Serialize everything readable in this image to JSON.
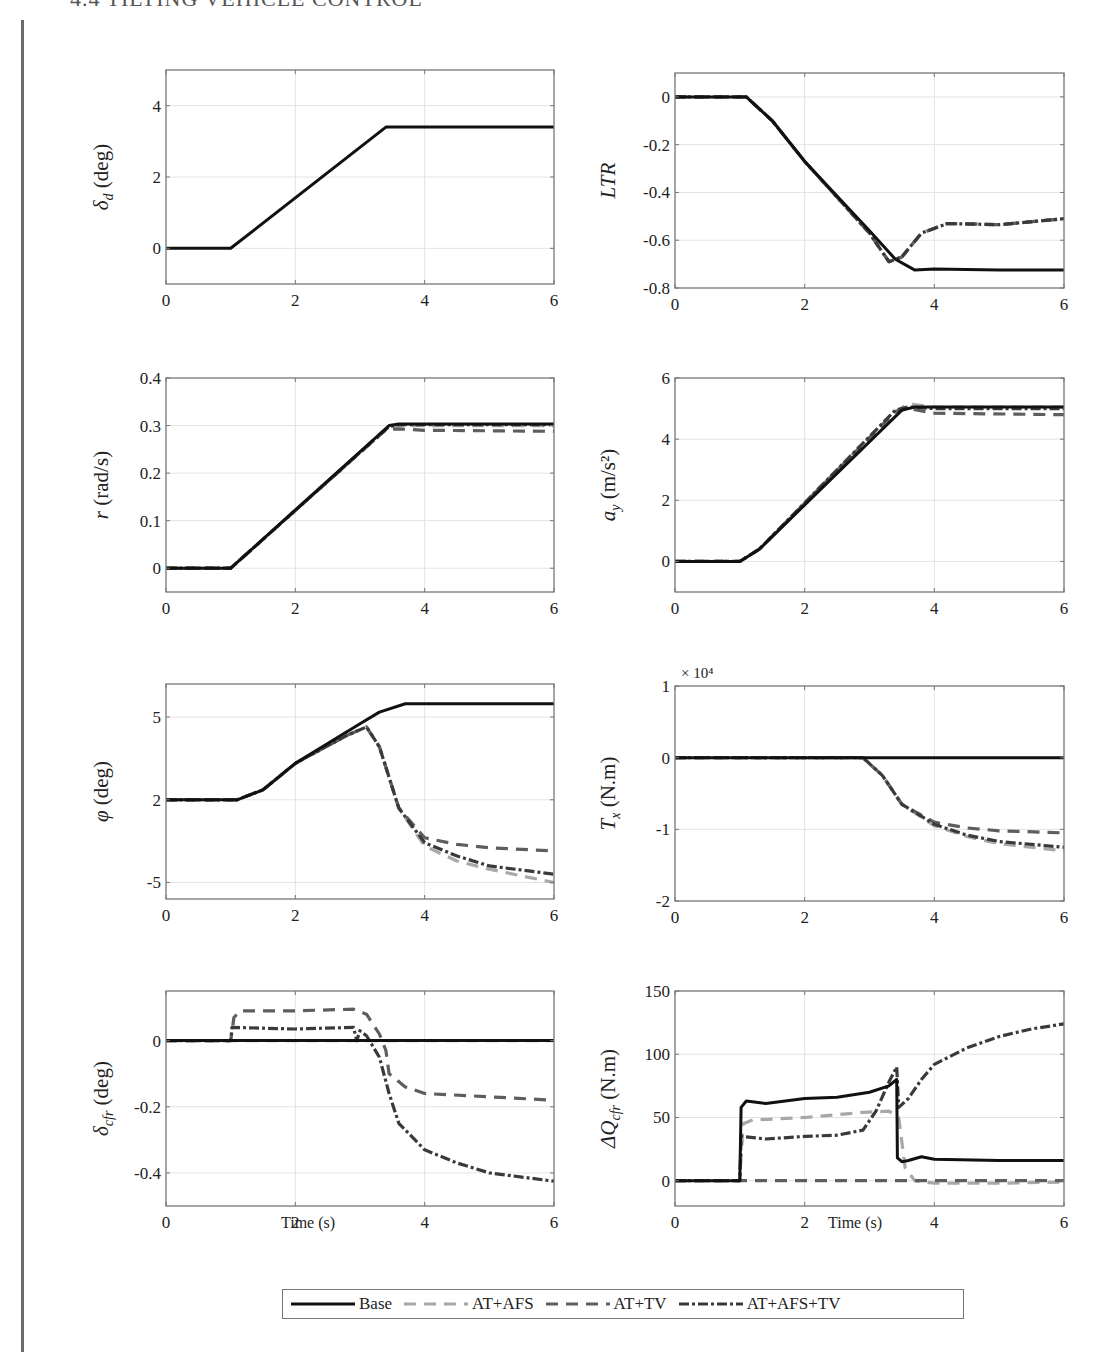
{
  "header": {
    "title": "4.4 TILTING VEHICLE CONTROL"
  },
  "legend": {
    "items": [
      {
        "label": "Base",
        "color": "#111111",
        "dash": "none"
      },
      {
        "label": "AT+AFS",
        "color": "#a8a8a8",
        "dash": "12,8"
      },
      {
        "label": "AT+TV",
        "color": "#5e5e5e",
        "dash": "12,8"
      },
      {
        "label": "AT+AFS+TV",
        "color": "#3a3a3a",
        "dash": "10,3,3,3"
      }
    ]
  },
  "xlabels": {
    "left": "Time (s)",
    "right": "Time (s)"
  },
  "chart_data": [
    {
      "id": "delta_d",
      "type": "line",
      "ylabel": "δd (deg)",
      "ylabel_main": "δ",
      "ylabel_sub": "d",
      "ylabel_unit": " (deg)",
      "xlim": [
        0,
        6
      ],
      "ylim": [
        -1,
        5
      ],
      "xticks": [
        0,
        2,
        4,
        6
      ],
      "yticks": [
        0,
        2,
        4
      ],
      "ytick_labels": [
        "0",
        "2",
        "4"
      ],
      "grid": true,
      "series": [
        {
          "name": "Base",
          "x": [
            0,
            1,
            3.4,
            6
          ],
          "y": [
            0,
            0,
            3.4,
            3.4
          ]
        }
      ]
    },
    {
      "id": "LTR",
      "type": "line",
      "ylabel": "LTR",
      "ylabel_main": "LTR",
      "ylabel_sub": "",
      "ylabel_unit": "",
      "xlim": [
        0,
        6
      ],
      "ylim": [
        -0.8,
        0.1
      ],
      "xticks": [
        0,
        2,
        4,
        6
      ],
      "yticks": [
        0,
        -0.2,
        -0.4,
        -0.6,
        -0.8
      ],
      "ytick_labels": [
        "0",
        "-0.2",
        "-0.4",
        "-0.6",
        "-0.8"
      ],
      "grid": true,
      "series": [
        {
          "name": "Base",
          "x": [
            0,
            1.1,
            1.5,
            2,
            3,
            3.4,
            3.7,
            4,
            5,
            6
          ],
          "y": [
            0,
            0,
            -0.1,
            -0.27,
            -0.56,
            -0.68,
            -0.725,
            -0.72,
            -0.725,
            -0.725
          ]
        },
        {
          "name": "AT+AFS",
          "x": [
            0,
            1.1,
            1.5,
            2,
            3,
            3.3,
            3.5,
            3.8,
            4.2,
            5,
            6
          ],
          "y": [
            0,
            0,
            -0.1,
            -0.27,
            -0.57,
            -0.69,
            -0.67,
            -0.57,
            -0.53,
            -0.535,
            -0.51
          ]
        },
        {
          "name": "AT+TV",
          "x": [
            0,
            1.1,
            1.5,
            2,
            3,
            3.3,
            3.5,
            3.8,
            4.2,
            5,
            6
          ],
          "y": [
            0,
            0,
            -0.1,
            -0.27,
            -0.57,
            -0.69,
            -0.67,
            -0.57,
            -0.53,
            -0.535,
            -0.51
          ]
        },
        {
          "name": "AT+AFS+TV",
          "x": [
            0,
            1.1,
            1.5,
            2,
            3,
            3.3,
            3.5,
            3.8,
            4.2,
            5,
            6
          ],
          "y": [
            0,
            0,
            -0.1,
            -0.27,
            -0.57,
            -0.69,
            -0.67,
            -0.57,
            -0.53,
            -0.535,
            -0.51
          ]
        }
      ]
    },
    {
      "id": "r",
      "type": "line",
      "ylabel": "r (rad/s)",
      "ylabel_main": "r",
      "ylabel_sub": "",
      "ylabel_unit": " (rad/s)",
      "xlim": [
        0,
        6
      ],
      "ylim": [
        -0.05,
        0.4
      ],
      "xticks": [
        0,
        2,
        4,
        6
      ],
      "yticks": [
        0,
        0.1,
        0.2,
        0.3,
        0.4
      ],
      "ytick_labels": [
        "0",
        "0.1",
        "0.2",
        "0.3",
        "0.4"
      ],
      "grid": true,
      "series": [
        {
          "name": "Base",
          "x": [
            0,
            1,
            3.45,
            3.6,
            6
          ],
          "y": [
            0,
            0,
            0.3,
            0.303,
            0.303
          ]
        },
        {
          "name": "AT+AFS",
          "x": [
            0,
            1,
            3.45,
            3.6,
            6
          ],
          "y": [
            0,
            0,
            0.297,
            0.3,
            0.3
          ]
        },
        {
          "name": "AT+TV",
          "x": [
            0,
            1,
            3.4,
            3.6,
            4,
            6
          ],
          "y": [
            0,
            0,
            0.292,
            0.293,
            0.29,
            0.288
          ]
        },
        {
          "name": "AT+AFS+TV",
          "x": [
            0,
            1,
            3.45,
            3.6,
            6
          ],
          "y": [
            0,
            0,
            0.298,
            0.302,
            0.302
          ]
        }
      ]
    },
    {
      "id": "ay",
      "type": "line",
      "ylabel": "ay (m/s²)",
      "ylabel_main": "a",
      "ylabel_sub": "y",
      "ylabel_unit": " (m/s²)",
      "xlim": [
        0,
        6
      ],
      "ylim": [
        -1,
        6
      ],
      "xticks": [
        0,
        2,
        4,
        6
      ],
      "yticks": [
        0,
        2,
        4,
        6
      ],
      "ytick_labels": [
        "0",
        "2",
        "4",
        "6"
      ],
      "grid": true,
      "series": [
        {
          "name": "Base",
          "x": [
            0,
            1,
            1.3,
            3.5,
            3.7,
            6
          ],
          "y": [
            0,
            0,
            0.4,
            4.95,
            5.05,
            5.05
          ]
        },
        {
          "name": "AT+AFS",
          "x": [
            0,
            1,
            1.3,
            3.4,
            3.6,
            4,
            6
          ],
          "y": [
            0,
            0,
            0.4,
            4.9,
            5.15,
            5.05,
            5.05
          ]
        },
        {
          "name": "AT+TV",
          "x": [
            0,
            1,
            1.3,
            3.4,
            3.6,
            4,
            6
          ],
          "y": [
            0,
            0,
            0.4,
            4.9,
            5.0,
            4.85,
            4.8
          ]
        },
        {
          "name": "AT+AFS+TV",
          "x": [
            0,
            1,
            1.3,
            3.4,
            3.6,
            4,
            6
          ],
          "y": [
            0,
            0,
            0.4,
            4.95,
            5.05,
            5.0,
            5.0
          ]
        }
      ]
    },
    {
      "id": "phi",
      "type": "line",
      "ylabel": "φ (deg)",
      "ylabel_main": "φ",
      "ylabel_sub": "",
      "ylabel_unit": " (deg)",
      "xlim": [
        0,
        6
      ],
      "ylim": [
        -6,
        7
      ],
      "xticks": [
        0,
        2,
        4,
        6
      ],
      "yticks": [
        5,
        0,
        -5
      ],
      "ytick_labels": [
        "5",
        "2",
        "-5"
      ],
      "grid": true,
      "series": [
        {
          "name": "Base",
          "x": [
            0,
            1.1,
            1.5,
            2,
            3,
            3.3,
            3.7,
            4,
            6
          ],
          "y": [
            0,
            0,
            0.6,
            2.2,
            4.6,
            5.3,
            5.8,
            5.8,
            5.8
          ]
        },
        {
          "name": "AT+AFS",
          "x": [
            0,
            1.1,
            1.5,
            2,
            2.8,
            3.1,
            3.3,
            3.6,
            4,
            4.5,
            5,
            6
          ],
          "y": [
            0,
            0,
            0.6,
            2.2,
            3.9,
            4.4,
            3.2,
            -0.5,
            -2.8,
            -3.7,
            -4.2,
            -5.0
          ]
        },
        {
          "name": "AT+TV",
          "x": [
            0,
            1.1,
            1.5,
            2,
            2.8,
            3.1,
            3.3,
            3.6,
            4,
            4.5,
            5,
            6
          ],
          "y": [
            0,
            0,
            0.6,
            2.2,
            3.9,
            4.4,
            3.2,
            -0.5,
            -2.3,
            -2.7,
            -2.9,
            -3.1
          ]
        },
        {
          "name": "AT+AFS+TV",
          "x": [
            0,
            1.1,
            1.5,
            2,
            2.8,
            3.1,
            3.3,
            3.6,
            4,
            4.5,
            5,
            6
          ],
          "y": [
            0,
            0,
            0.6,
            2.2,
            3.9,
            4.4,
            3.2,
            -0.5,
            -2.6,
            -3.4,
            -4.0,
            -4.5
          ]
        }
      ]
    },
    {
      "id": "Tx",
      "type": "line",
      "ylabel": "Tx (N.m)",
      "ylabel_main": "T",
      "ylabel_sub": "x",
      "ylabel_unit": " (N.m)",
      "xlim": [
        0,
        6
      ],
      "ylim": [
        -2,
        1
      ],
      "xticks": [
        0,
        2,
        4,
        6
      ],
      "yticks": [
        1,
        0,
        -1,
        -2
      ],
      "ytick_labels": [
        "1",
        "0",
        "-1",
        "-2"
      ],
      "grid": true,
      "scale_label": "× 10⁴",
      "series": [
        {
          "name": "Base",
          "x": [
            0,
            6
          ],
          "y": [
            0,
            0
          ]
        },
        {
          "name": "AT+AFS",
          "x": [
            0,
            2.9,
            3.2,
            3.5,
            4,
            4.5,
            5,
            6
          ],
          "y": [
            0,
            0,
            -0.25,
            -0.65,
            -0.95,
            -1.1,
            -1.2,
            -1.3
          ]
        },
        {
          "name": "AT+TV",
          "x": [
            0,
            2.9,
            3.2,
            3.5,
            4,
            4.5,
            5,
            6
          ],
          "y": [
            0,
            0,
            -0.25,
            -0.65,
            -0.9,
            -0.98,
            -1.02,
            -1.05
          ]
        },
        {
          "name": "AT+AFS+TV",
          "x": [
            0,
            2.9,
            3.2,
            3.5,
            4,
            4.5,
            5,
            6
          ],
          "y": [
            0,
            0,
            -0.25,
            -0.65,
            -0.93,
            -1.08,
            -1.17,
            -1.25
          ]
        }
      ]
    },
    {
      "id": "delta_cfr",
      "type": "line",
      "ylabel": "δcfr (deg)",
      "ylabel_main": "δ",
      "ylabel_sub": "cfr",
      "ylabel_unit": " (deg)",
      "xlim": [
        0,
        6
      ],
      "ylim": [
        -0.5,
        0.15
      ],
      "xticks": [
        0,
        2,
        4,
        6
      ],
      "yticks": [
        0,
        -0.2,
        -0.4
      ],
      "ytick_labels": [
        "0",
        "-0.2",
        "-0.4"
      ],
      "grid": true,
      "series": [
        {
          "name": "Base",
          "x": [
            0,
            6
          ],
          "y": [
            0,
            0
          ]
        },
        {
          "name": "AT+AFS",
          "x": [
            0,
            6
          ],
          "y": [
            0,
            0
          ]
        },
        {
          "name": "AT+TV",
          "x": [
            0,
            1,
            1.05,
            1.15,
            2,
            2.9,
            3.1,
            3.3,
            3.4,
            3.45,
            3.7,
            4,
            5,
            6
          ],
          "y": [
            0,
            0,
            0.07,
            0.09,
            0.09,
            0.095,
            0.08,
            0.02,
            -0.03,
            -0.1,
            -0.14,
            -0.16,
            -0.17,
            -0.18
          ]
        },
        {
          "name": "AT+AFS+TV",
          "x": [
            0,
            1,
            1.02,
            2,
            2.9,
            2.95,
            3.0,
            3.1,
            3.3,
            3.45,
            3.6,
            4,
            4.5,
            5,
            6
          ],
          "y": [
            0,
            0,
            0.04,
            0.035,
            0.04,
            0.0,
            0.03,
            0.015,
            -0.05,
            -0.16,
            -0.25,
            -0.33,
            -0.37,
            -0.4,
            -0.425
          ]
        }
      ]
    },
    {
      "id": "dQcfr",
      "type": "line",
      "ylabel": "ΔQcfr (N.m)",
      "ylabel_main": "ΔQ",
      "ylabel_sub": "cfr",
      "ylabel_unit": " (N.m)",
      "xlim": [
        0,
        6
      ],
      "ylim": [
        -20,
        150
      ],
      "xticks": [
        0,
        2,
        4,
        6
      ],
      "yticks": [
        0,
        50,
        100,
        150
      ],
      "ytick_labels": [
        "0",
        "50",
        "100",
        "150"
      ],
      "grid": true,
      "series": [
        {
          "name": "Base",
          "x": [
            0,
            1,
            1.02,
            1.1,
            1.4,
            2,
            2.5,
            3,
            3.3,
            3.42,
            3.43,
            3.5,
            3.6,
            3.8,
            4,
            5,
            6
          ],
          "y": [
            0,
            0,
            58,
            63,
            61,
            65,
            66,
            70,
            75,
            80,
            18,
            15,
            16,
            19,
            17,
            16,
            16
          ]
        },
        {
          "name": "AT+AFS",
          "x": [
            0,
            1,
            1.05,
            1.2,
            2,
            2.9,
            3.3,
            3.45,
            3.55,
            3.7,
            4,
            5,
            6
          ],
          "y": [
            0,
            0,
            45,
            48,
            50,
            54,
            55,
            50,
            10,
            0,
            -2,
            -2,
            -1
          ]
        },
        {
          "name": "AT+TV",
          "x": [
            0,
            6
          ],
          "y": [
            0,
            0
          ]
        },
        {
          "name": "AT+AFS+TV",
          "x": [
            0,
            1,
            1.02,
            1.4,
            2,
            2.5,
            2.9,
            3.1,
            3.3,
            3.42,
            3.45,
            3.6,
            3.8,
            4,
            4.5,
            5,
            5.5,
            6
          ],
          "y": [
            0,
            0,
            35,
            33,
            35,
            36,
            40,
            55,
            78,
            90,
            58,
            65,
            80,
            92,
            105,
            114,
            120,
            124
          ]
        }
      ]
    }
  ]
}
